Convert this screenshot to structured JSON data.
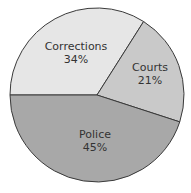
{
  "chart_data": {
    "type": "pie",
    "title": "",
    "categories": [
      "Corrections",
      "Courts",
      "Police"
    ],
    "values": [
      34,
      21,
      45
    ],
    "unit": "%",
    "labels": [
      "34%",
      "21%",
      "45%"
    ],
    "colors": [
      "#e6e6e6",
      "#c9c9c9",
      "#a8a8a8"
    ],
    "start_angle_deg": 270,
    "direction": "clockwise",
    "legend": "none (labels inside slices)"
  },
  "slices": [
    {
      "name": "Corrections",
      "pct": "34%"
    },
    {
      "name": "Courts",
      "pct": "21%"
    },
    {
      "name": "Police",
      "pct": "45%"
    }
  ]
}
